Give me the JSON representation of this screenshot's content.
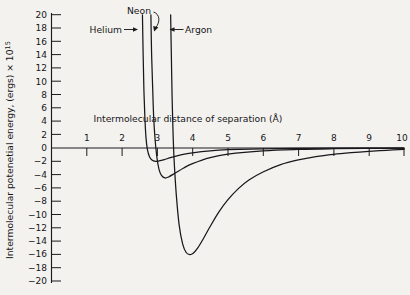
{
  "chart_data": {
    "type": "line",
    "title": "",
    "xlabel": "Intermolecular distance of separation (Å)",
    "ylabel": "Intermolecular potenetial energy, (ergs) × 10",
    "ylabel_exponent": "15",
    "xlim": [
      0,
      10
    ],
    "ylim": [
      -20,
      20
    ],
    "grid": false,
    "legend": "inline-annotations",
    "xticks": [
      1,
      2,
      3,
      4,
      5,
      6,
      7,
      8,
      9,
      10
    ],
    "xtick_labels": [
      "1",
      "2",
      "3",
      "4",
      "5",
      "6",
      "7",
      "8",
      "9",
      "10"
    ],
    "yticks": [
      20,
      18,
      16,
      14,
      12,
      10,
      8,
      6,
      4,
      2,
      0,
      -2,
      -4,
      -6,
      -8,
      -10,
      -12,
      -14,
      -16,
      -18,
      -20
    ],
    "ytick_labels": [
      "20",
      "18",
      "16",
      "14",
      "12",
      "10",
      "8",
      "6",
      "4",
      "2",
      "0",
      "−2",
      "−4",
      "−6",
      "−8",
      "−10",
      "−12",
      "−14",
      "−16",
      "−18",
      "−20"
    ],
    "series": [
      {
        "name": "Helium",
        "label": "Helium",
        "color": "#18181c",
        "well_depth": -2.0,
        "well_position": 3.0,
        "sigma": 2.64,
        "points": [
          [
            2.58,
            20.0
          ],
          [
            2.6,
            14.0
          ],
          [
            2.62,
            9.0
          ],
          [
            2.65,
            4.5
          ],
          [
            2.68,
            1.6
          ],
          [
            2.72,
            -0.2
          ],
          [
            2.78,
            -1.3
          ],
          [
            2.85,
            -1.8
          ],
          [
            2.95,
            -2.0
          ],
          [
            3.05,
            -1.95
          ],
          [
            3.2,
            -1.75
          ],
          [
            3.4,
            -1.4
          ],
          [
            3.7,
            -1.0
          ],
          [
            4.0,
            -0.72
          ],
          [
            4.5,
            -0.42
          ],
          [
            5.0,
            -0.26
          ],
          [
            6.0,
            -0.12
          ],
          [
            7.0,
            -0.06
          ],
          [
            8.0,
            -0.03
          ],
          [
            9.0,
            -0.015
          ],
          [
            10.0,
            -0.01
          ]
        ]
      },
      {
        "name": "Neon",
        "label": "Neon",
        "color": "#18181c",
        "well_depth": -4.5,
        "well_position": 3.22,
        "sigma": 2.88,
        "points": [
          [
            2.82,
            20.0
          ],
          [
            2.84,
            14.0
          ],
          [
            2.87,
            9.0
          ],
          [
            2.9,
            4.5
          ],
          [
            2.94,
            1.2
          ],
          [
            2.99,
            -1.4
          ],
          [
            3.05,
            -3.2
          ],
          [
            3.12,
            -4.1
          ],
          [
            3.22,
            -4.5
          ],
          [
            3.32,
            -4.35
          ],
          [
            3.5,
            -3.8
          ],
          [
            3.75,
            -3.0
          ],
          [
            4.0,
            -2.35
          ],
          [
            4.5,
            -1.45
          ],
          [
            5.0,
            -0.92
          ],
          [
            6.0,
            -0.42
          ],
          [
            7.0,
            -0.21
          ],
          [
            8.0,
            -0.11
          ],
          [
            9.0,
            -0.06
          ],
          [
            10.0,
            -0.03
          ]
        ]
      },
      {
        "name": "Argon",
        "label": "Argon",
        "color": "#18181c",
        "well_depth": -16.0,
        "well_position": 3.92,
        "sigma": 3.46,
        "points": [
          [
            3.38,
            20.0
          ],
          [
            3.4,
            14.0
          ],
          [
            3.42,
            8.0
          ],
          [
            3.45,
            2.0
          ],
          [
            3.48,
            -2.0
          ],
          [
            3.54,
            -7.0
          ],
          [
            3.62,
            -11.5
          ],
          [
            3.72,
            -14.4
          ],
          [
            3.82,
            -15.7
          ],
          [
            3.92,
            -16.0
          ],
          [
            4.02,
            -15.8
          ],
          [
            4.15,
            -15.0
          ],
          [
            4.3,
            -13.7
          ],
          [
            4.5,
            -11.8
          ],
          [
            4.75,
            -9.6
          ],
          [
            5.0,
            -7.8
          ],
          [
            5.3,
            -6.1
          ],
          [
            5.6,
            -4.8
          ],
          [
            6.0,
            -3.6
          ],
          [
            6.5,
            -2.5
          ],
          [
            7.0,
            -1.8
          ],
          [
            7.5,
            -1.3
          ],
          [
            8.0,
            -0.95
          ],
          [
            8.5,
            -0.7
          ],
          [
            9.0,
            -0.5
          ],
          [
            9.5,
            -0.34
          ],
          [
            10.0,
            -0.22
          ]
        ]
      }
    ],
    "annotations": [
      {
        "text": "Helium",
        "arrow": "right",
        "target_x": 2.6,
        "target_y": 18.2
      },
      {
        "text": "Neon",
        "arrow": "curved-down",
        "target_x": 2.9,
        "target_y": 18.4
      },
      {
        "text": "Argon",
        "arrow": "left",
        "target_x": 3.4,
        "target_y": 18.2
      }
    ]
  }
}
